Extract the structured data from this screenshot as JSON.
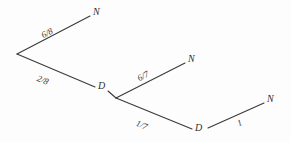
{
  "diagram": {
    "type": "probability-tree",
    "background_color": "#fdfdfd",
    "line_color": "#3a3a3a",
    "text_color": "#2f2f2f",
    "nodes": [
      {
        "id": "root",
        "label": "",
        "x": 17,
        "y": 54
      },
      {
        "id": "n1",
        "label": "N",
        "x": 96,
        "y": 13
      },
      {
        "id": "d1",
        "label": "D",
        "x": 101,
        "y": 87
      },
      {
        "id": "split2",
        "label": "",
        "x": 116,
        "y": 98
      },
      {
        "id": "n2",
        "label": "N",
        "x": 191,
        "y": 60
      },
      {
        "id": "d2",
        "label": "D",
        "x": 198,
        "y": 129
      },
      {
        "id": "n3",
        "label": "N",
        "x": 270,
        "y": 100
      }
    ],
    "edges": [
      {
        "id": "e1",
        "from": "root",
        "to": "n1",
        "probability": "6/8",
        "x1": 17,
        "y1": 54,
        "x2": 90,
        "y2": 16,
        "label_x": 40,
        "label_y": 32,
        "angle": -27.5
      },
      {
        "id": "e2",
        "from": "root",
        "to": "d1",
        "probability": "2/8",
        "x1": 17,
        "y1": 54,
        "x2": 95,
        "y2": 87,
        "label_x": 39,
        "label_y": 74,
        "angle": 23.0
      },
      {
        "id": "e3",
        "from": "split2",
        "to": "n2",
        "probability": "6/7",
        "x1": 116,
        "y1": 98,
        "x2": 185,
        "y2": 63,
        "label_x": 136,
        "label_y": 75,
        "angle": -26.9
      },
      {
        "id": "e4",
        "from": "split2",
        "to": "d2",
        "probability": "1/7",
        "x1": 116,
        "y1": 98,
        "x2": 192,
        "y2": 129,
        "label_x": 138,
        "label_y": 119,
        "angle": 22.2
      },
      {
        "id": "e5",
        "from": "d2",
        "to": "n3",
        "probability": "1",
        "x1": 208,
        "y1": 128,
        "x2": 264,
        "y2": 103,
        "label_x": 236,
        "label_y": 120,
        "angle": -24.1
      }
    ]
  }
}
